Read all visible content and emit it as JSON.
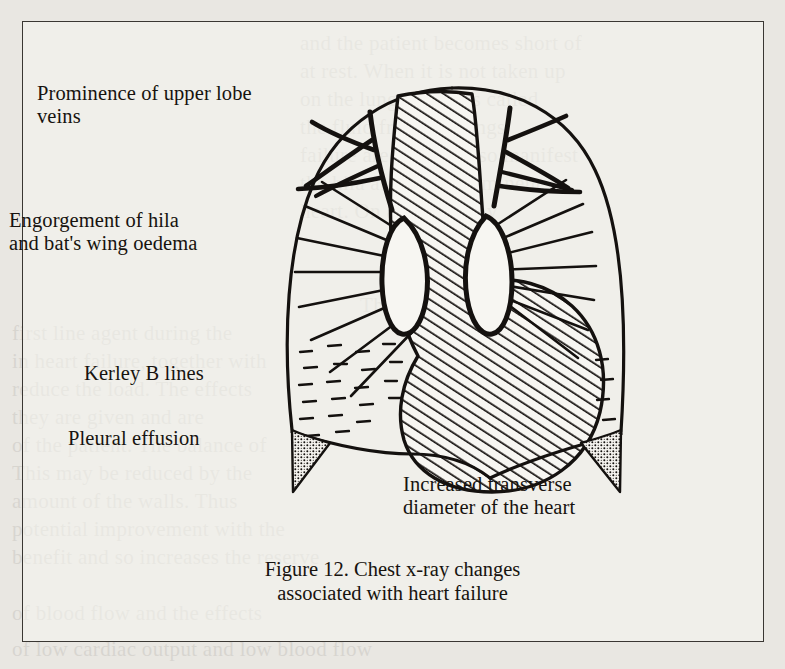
{
  "figure": {
    "caption": "Figure 12. Chest x-ray changes\nassociated with heart failure",
    "caption_line1": "Figure 12. Chest x-ray changes",
    "caption_line2": "associated with heart failure",
    "number": "Figure 12",
    "frame_border_color": "#3a3733",
    "page_background": "#e9e7e2",
    "ink_color": "#14110f"
  },
  "labels": {
    "upper_lobe_veins": "Prominence of upper lobe\nveins",
    "hila_oedema": "Engorgement of hila\nand bat's wing oedema",
    "kerley_b_lines": "Kerley B lines",
    "pleural_effusion": "Pleural effusion",
    "heart_diameter": "Increased transverse\ndiameter of the heart"
  },
  "ghost_text": [
    {
      "text": "and the patient becomes short of",
      "x": 300,
      "y": 28
    },
    {
      "text": "at rest. When it is not taken up",
      "x": 300,
      "y": 56
    },
    {
      "text": "on the lungs and it is called",
      "x": 300,
      "y": 84
    },
    {
      "text": "the fluid from the lungs",
      "x": 300,
      "y": 112
    },
    {
      "text": "failure are usually also manifest",
      "x": 300,
      "y": 140
    },
    {
      "text": "the hila are often prominent",
      "x": 300,
      "y": 168
    },
    {
      "text": "heart. On a chest x-ray",
      "x": 300,
      "y": 196
    },
    {
      "text": "Therapy",
      "x": 360,
      "y": 290
    },
    {
      "text": "first line agent during the",
      "x": 12,
      "y": 318
    },
    {
      "text": "in heart failure, together with",
      "x": 12,
      "y": 346
    },
    {
      "text": "reduce the load. The effects",
      "x": 12,
      "y": 374
    },
    {
      "text": "they are given and are",
      "x": 12,
      "y": 402
    },
    {
      "text": "of the patient. The balance of",
      "x": 12,
      "y": 430
    },
    {
      "text": "This may be reduced by the",
      "x": 12,
      "y": 458
    },
    {
      "text": "amount of the walls. Thus",
      "x": 12,
      "y": 486
    },
    {
      "text": "potential improvement with the",
      "x": 12,
      "y": 514
    },
    {
      "text": "benefit and so increases the reserve",
      "x": 12,
      "y": 542
    },
    {
      "text": "of blood flow and the effects",
      "x": 12,
      "y": 598
    },
    {
      "text": "of low cardiac output and low blood flow",
      "x": 12,
      "y": 634
    }
  ],
  "drawing": {
    "type": "chest-radiograph-schematic",
    "elements": [
      "chest-outline",
      "mediastinum-heart-hatched",
      "left-hilum",
      "right-hilum",
      "bat-wing-radiating-lines",
      "upper-lobe-veins",
      "kerley-b-lines",
      "left-pleural-effusion",
      "right-pleural-effusion",
      "diaphragm"
    ]
  }
}
